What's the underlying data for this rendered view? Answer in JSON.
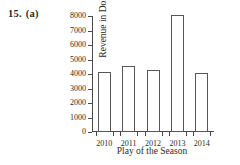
{
  "problem": {
    "number": "15.",
    "part": "(a)"
  },
  "chart_data": {
    "type": "bar",
    "title": "",
    "subtitle": "",
    "xlabel": "Play of the Season",
    "ylabel": "Revenue in Dollars",
    "categories": [
      "2010",
      "2011",
      "2012",
      "2013",
      "2014"
    ],
    "values": [
      4150,
      4550,
      4300,
      8100,
      4050
    ],
    "series": [
      {
        "name": "Revenue",
        "values": [
          4150,
          4550,
          4300,
          8100,
          4050
        ]
      }
    ],
    "ylim": [
      0,
      8000
    ],
    "ytick_labels": [
      "0",
      "1000",
      "2000",
      "3000",
      "4000",
      "5000",
      "6000",
      "7000",
      "8000"
    ],
    "ytick_values": [
      0,
      1000,
      2000,
      3000,
      4000,
      5000,
      6000,
      7000,
      8000
    ],
    "grid": false,
    "legend": false,
    "legend_position": "none",
    "bar_fill_color": "#ffffff",
    "bar_edge_color": "#575757",
    "axis_color": "#4a4a4a",
    "text_color": "#2b2b2b"
  }
}
